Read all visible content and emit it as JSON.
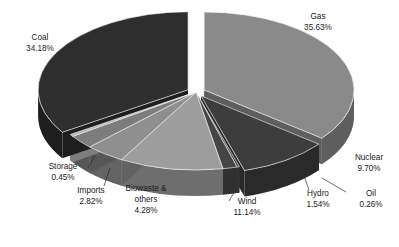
{
  "chart_data": {
    "type": "pie",
    "title": "",
    "subtitle": "",
    "xlabel": "",
    "ylabel": "",
    "legend_position": "none",
    "grid": false,
    "three_d": true,
    "exploded": true,
    "value_unit": "percent",
    "categories": [
      "Gas",
      "Nuclear",
      "Oil",
      "Hydro",
      "Wind",
      "Biowaste & others",
      "Imports",
      "Storage",
      "Coal"
    ],
    "values": [
      35.63,
      9.7,
      0.26,
      1.54,
      11.14,
      4.28,
      2.82,
      0.45,
      34.18
    ],
    "slices": [
      {
        "name": "Gas",
        "label": "Gas",
        "value": 35.63,
        "value_text": "35.63%",
        "color": "#8a8a8a",
        "side_color": "#5e5e5e",
        "exploded": true,
        "label_x": 318,
        "label_y": 22,
        "label_lines": [
          "Gas",
          "35.63%"
        ]
      },
      {
        "name": "Nuclear",
        "label": "Nuclear",
        "value": 9.7,
        "value_text": "9.70%",
        "color": "#3d3d3d",
        "side_color": "#2a2a2a",
        "exploded": true,
        "label_x": 369,
        "label_y": 163,
        "label_lines": [
          "Nuclear",
          "9.70%"
        ]
      },
      {
        "name": "Oil",
        "label": "Oil",
        "value": 0.26,
        "value_text": "0.26%",
        "color": "#4a4a4a",
        "side_color": "#343434",
        "exploded": false,
        "label_x": 371,
        "label_y": 199,
        "label_lines": [
          "Oil",
          "0.26%"
        ]
      },
      {
        "name": "Hydro",
        "label": "Hydro",
        "value": 1.54,
        "value_text": "1.54%",
        "color": "#454545",
        "side_color": "#303030",
        "exploded": false,
        "label_x": 318,
        "label_y": 199,
        "label_lines": [
          "Hydro",
          "1.54%"
        ]
      },
      {
        "name": "Wind",
        "label": "Wind",
        "value": 11.14,
        "value_text": "11.14%",
        "color": "#9e9e9e",
        "side_color": "#6e6e6e",
        "exploded": false,
        "label_x": 247,
        "label_y": 207,
        "label_lines": [
          "Wind",
          "11.14%"
        ]
      },
      {
        "name": "Biowaste",
        "label": "Biowaste & others",
        "value": 4.28,
        "value_text": "4.28%",
        "color": "#8f8f8f",
        "side_color": "#636363",
        "exploded": false,
        "label_x": 146,
        "label_y": 200,
        "label_lines": [
          "Biowaste &",
          "others",
          "4.28%"
        ]
      },
      {
        "name": "Imports",
        "label": "Imports",
        "value": 2.82,
        "value_text": "2.82%",
        "color": "#7d7d7d",
        "side_color": "#565656",
        "exploded": false,
        "label_x": 91,
        "label_y": 196,
        "label_lines": [
          "Imports",
          "2.82%"
        ]
      },
      {
        "name": "Storage",
        "label": "Storage",
        "value": 0.45,
        "value_text": "0.45%",
        "color": "#b4b4b4",
        "side_color": "#7e7e7e",
        "exploded": false,
        "label_x": 63,
        "label_y": 172,
        "label_lines": [
          "Storage",
          "0.45%"
        ]
      },
      {
        "name": "Coal",
        "label": "Coal",
        "value": 34.18,
        "value_text": "34.18%",
        "color": "#2e2e2e",
        "side_color": "#1e1e1e",
        "exploded": true,
        "label_x": 40,
        "label_y": 43,
        "label_lines": [
          "Coal",
          "34.18%"
        ]
      }
    ],
    "leader_lines": [
      {
        "name": "leader-oil",
        "x1": 322,
        "y1": 178,
        "x2": 346,
        "y2": 192
      },
      {
        "name": "leader-hydro",
        "x1": 304,
        "y1": 176,
        "x2": 309,
        "y2": 190
      },
      {
        "name": "leader-wind",
        "x1": 238,
        "y1": 186,
        "x2": 229,
        "y2": 201
      },
      {
        "name": "leader-imports",
        "x1": 110,
        "y1": 168,
        "x2": 104,
        "y2": 186
      },
      {
        "name": "leader-storage",
        "x1": 95,
        "y1": 156,
        "x2": 88,
        "y2": 168
      }
    ],
    "geometry": {
      "center_x": 196,
      "center_y": 92,
      "radius_x": 150,
      "radius_y": 78,
      "depth": 26,
      "start_angle_deg": -90,
      "explode_offset": 9,
      "background": "#ffffff",
      "text_color": "#1a1a1a"
    }
  }
}
